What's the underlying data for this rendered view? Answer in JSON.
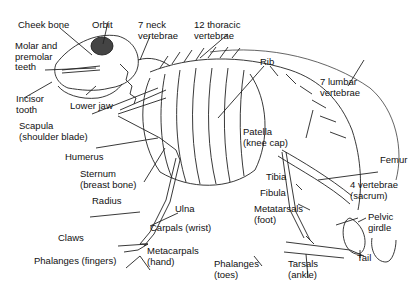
{
  "labels": {
    "cheek_bone": "Cheek bone",
    "orbit": "Orbit",
    "neck_vertebrae_1": "7 neck",
    "neck_vertebrae_2": "vertebrae",
    "thoracic_1": "12 thoracic",
    "thoracic_2": "vertebrae",
    "molar_1": "Molar and",
    "molar_2": "premolar",
    "molar_3": "teeth",
    "rib": "Rib",
    "lumbar_1": "7 lumbar",
    "lumbar_2": "vertebrae",
    "incisor_1": "Incisor",
    "incisor_2": "tooth",
    "lower_jaw": "Lower jaw",
    "scapula_1": "Scapula",
    "scapula_2": "(shoulder blade)",
    "patella_1": "Patella",
    "patella_2": "(knee cap)",
    "humerus": "Humerus",
    "femur": "Femur",
    "sternum_1": "Sternum",
    "sternum_2": "(breast bone)",
    "tibia": "Tibia",
    "sacrum_1": "4 vertebrae",
    "sacrum_2": "(sacrum)",
    "fibula": "Fibula",
    "radius": "Radius",
    "ulna": "Ulna",
    "metatarsals_1": "Metatarsals",
    "metatarsals_2": "(foot)",
    "pelvic_1": "Pelvic",
    "pelvic_2": "girdle",
    "carpals": "Carpals (wrist)",
    "claws": "Claws",
    "metacarpals_1": "Metacarpals",
    "metacarpals_2": "(hand)",
    "tail": "Tail",
    "phalanges_fingers": "Phalanges (fingers)",
    "phalanges_toes_1": "Phalanges",
    "phalanges_toes_2": "(toes)",
    "tarsals_1": "Tarsals",
    "tarsals_2": "(ankle)"
  }
}
